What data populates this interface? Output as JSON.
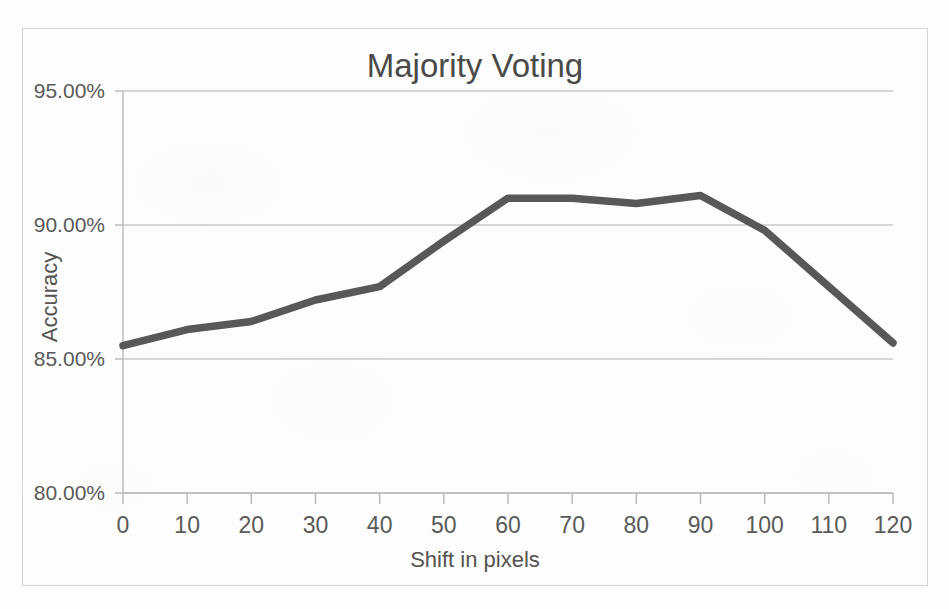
{
  "chart_data": {
    "type": "line",
    "title": "Majority Voting",
    "xlabel": "Shift in pixels",
    "ylabel": "Accuracy",
    "x": [
      0,
      10,
      20,
      30,
      40,
      50,
      60,
      70,
      80,
      90,
      100,
      110,
      120
    ],
    "values": [
      85.5,
      86.1,
      86.4,
      87.2,
      87.7,
      89.4,
      91.0,
      91.0,
      90.8,
      91.1,
      89.8,
      87.7,
      85.6
    ],
    "series": [
      {
        "name": "Accuracy",
        "values": [
          85.5,
          86.1,
          86.4,
          87.2,
          87.7,
          89.4,
          91.0,
          91.0,
          90.8,
          91.1,
          89.8,
          87.7,
          85.6
        ]
      }
    ],
    "xlim": [
      0,
      120
    ],
    "ylim": [
      80,
      95
    ],
    "ytick_values": [
      95,
      90,
      85,
      80
    ],
    "ytick_labels": [
      "95.00%",
      "90.00%",
      "85.00%",
      "80.00%"
    ],
    "xtick_labels": [
      "0",
      "10",
      "20",
      "30",
      "40",
      "50",
      "60",
      "70",
      "80",
      "90",
      "100",
      "110",
      "120"
    ],
    "grid": "horizontal",
    "legend": "none",
    "line_color": "#595856",
    "grid_color": "#c9c9c7",
    "axis_color": "#b9b9b7",
    "text_color": "#56565400"
  },
  "colors": {
    "line": "#595856",
    "gridline": "#c9c9c7",
    "axis": "#b8b8b6",
    "frame": "#d5d5d3",
    "title_text": "#4a4a48",
    "label_text": "#5a5a58",
    "background": "#fdfdfc"
  }
}
